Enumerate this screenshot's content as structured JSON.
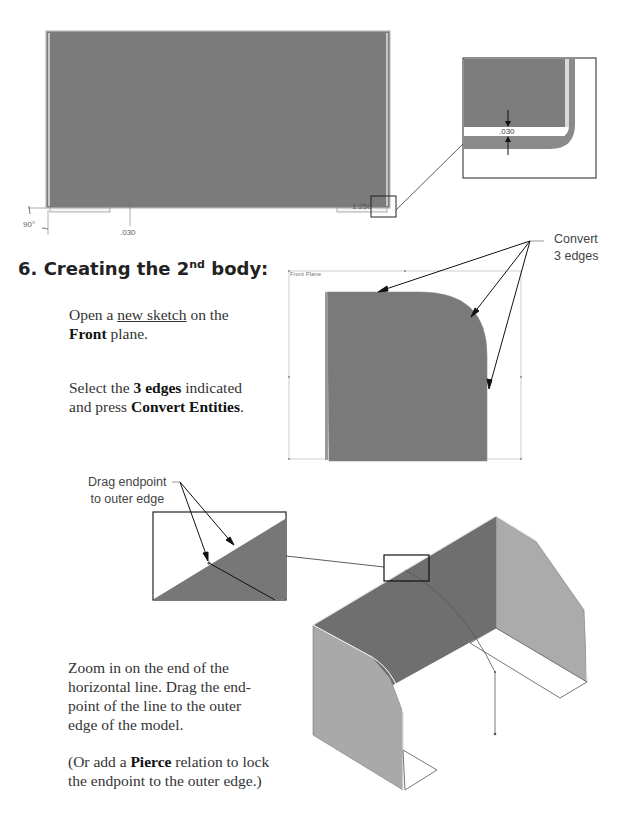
{
  "step": {
    "number": "6.",
    "title_prefix": "Creating the 2",
    "title_sup": "nd",
    "title_suffix": " body:"
  },
  "instructions": {
    "p1": {
      "open": "Open a ",
      "link": "new sketch",
      "mid": " on the",
      "bold": "Front",
      "end": " plane."
    },
    "p2": {
      "start": "Select the ",
      "bold1": "3 edges",
      "mid": " indicated and press ",
      "bold2": "Convert Entities",
      "end": "."
    },
    "p3": "Zoom in on the end of the horizontal line. Drag the end-point of the line to the outer edge of the model.",
    "p4": {
      "start": "(Or add a ",
      "bold": "Pierce",
      "end": " relation to lock the endpoint to the outer edge.)"
    }
  },
  "figures": {
    "top_view": {
      "dimensions": {
        "angle": "90°",
        "thickness": ".030",
        "length": "1.250"
      }
    },
    "detail_view": {
      "dimension": ".030"
    },
    "front_plane": {
      "label": "Front Plane",
      "callout_line1": "Convert",
      "callout_line2": "3 edges"
    },
    "iso_view": {
      "callout_line1": "Drag endpoint",
      "callout_line2": "to outer edge"
    }
  },
  "colors": {
    "body_fill": "#7a7a7a",
    "side_fill": "#a8a8a8",
    "line": "#222222"
  }
}
